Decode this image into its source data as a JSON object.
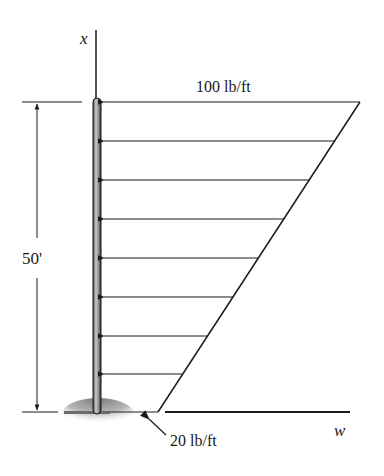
{
  "figure": {
    "type": "distributed-load-diagram",
    "axis_labels": {
      "vertical": "x",
      "horizontal": "w"
    },
    "top_load_label": "100 lb/ft",
    "bottom_load_label": "20 lb/ft",
    "height_dimension_label": "50'",
    "load": {
      "top_intensity": 100,
      "bottom_intensity": 20,
      "unit": "lb/ft",
      "distribution": "linear",
      "arrow_count": 8
    },
    "member": {
      "length": 50,
      "unit": "ft",
      "support": "fixed-ground"
    },
    "colors": {
      "line": "#1a1a1a",
      "pole_fill": "#9a9a9a",
      "ground_shade": "#8a8a8a"
    }
  }
}
